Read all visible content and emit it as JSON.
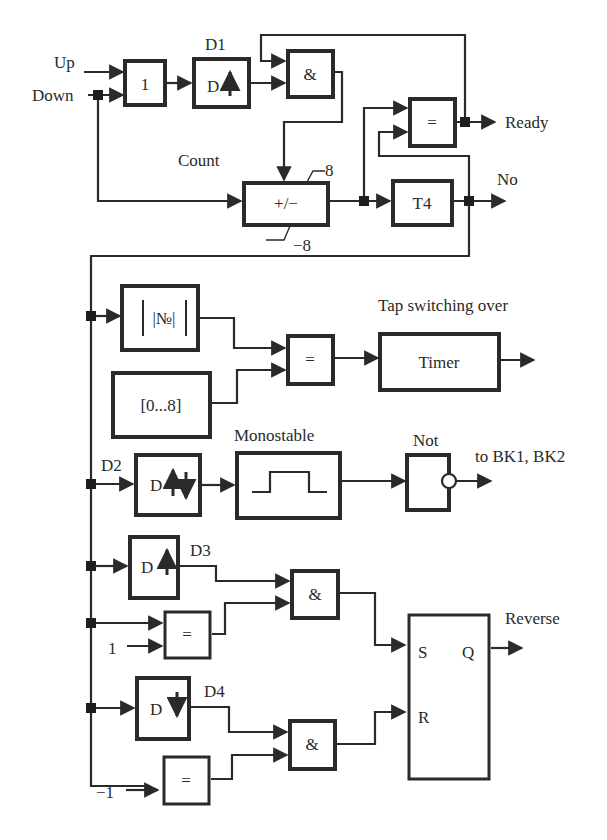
{
  "diagram": {
    "type": "logic block diagram",
    "inputs": {
      "up": "Up",
      "down": "Down"
    },
    "blocks": {
      "or": {
        "symbol": "1"
      },
      "d1": {
        "label": "D1",
        "symbol": "D",
        "edge": "rising"
      },
      "and_top": {
        "symbol": "&"
      },
      "counter": {
        "symbol": "+/−",
        "label": "Count",
        "upper_limit": "8",
        "lower_limit": "−8"
      },
      "eq_top": {
        "symbol": "="
      },
      "t4": {
        "symbol": "T4"
      },
      "abs": {
        "symbol": "|№|"
      },
      "range": {
        "symbol": "[0...8]"
      },
      "eq_mid": {
        "symbol": "="
      },
      "timer": {
        "symbol": "Timer",
        "label": "Tap switching over"
      },
      "d2": {
        "label": "D2",
        "symbol": "D",
        "edge": "both"
      },
      "monostable": {
        "label": "Monostable"
      },
      "not": {
        "label": "Not"
      },
      "d3": {
        "label": "D3",
        "symbol": "D",
        "edge": "rising"
      },
      "eq_one": {
        "symbol": "=",
        "const_input": "1"
      },
      "and_d3": {
        "symbol": "&"
      },
      "d4": {
        "label": "D4",
        "symbol": "D",
        "edge": "falling"
      },
      "eq_minus_one": {
        "symbol": "=",
        "const_input": "−1"
      },
      "and_d4": {
        "symbol": "&"
      },
      "sr": {
        "set": "S",
        "reset": "R",
        "out": "Q"
      }
    },
    "outputs": {
      "ready": "Ready",
      "no": "No",
      "bk": "to BK1, BK2",
      "reverse": "Reverse"
    }
  }
}
